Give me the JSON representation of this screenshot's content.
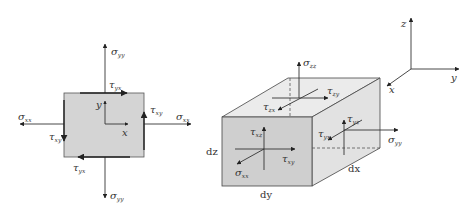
{
  "colors": {
    "background": "#ffffff",
    "line": "#333333",
    "square_fill": "#d4d4d4",
    "front_face": "#cfcfcf",
    "top_face": "#ebebeb",
    "side_face": "#e2e2e2"
  },
  "plane_element": {
    "labels": {
      "sigma_yy_top": {
        "sym": "σ",
        "sub": "yy"
      },
      "sigma_yy_bottom": {
        "sym": "σ",
        "sub": "yy"
      },
      "sigma_xx_left": {
        "sym": "σ",
        "sub": "xx"
      },
      "sigma_xx_right": {
        "sym": "σ",
        "sub": "xx"
      },
      "tau_yx_top": {
        "sym": "τ",
        "sub": "yx"
      },
      "tau_yx_bottom": {
        "sym": "τ",
        "sub": "yx"
      },
      "tau_xy_left": {
        "sym": "τ",
        "sub": "xy"
      },
      "tau_xy_right": {
        "sym": "τ",
        "sub": "xy"
      },
      "axis_x": "x",
      "axis_y": "y"
    }
  },
  "cube_element": {
    "labels": {
      "sigma_zz": {
        "sym": "σ",
        "sub": "zz"
      },
      "tau_zx": {
        "sym": "τ",
        "sub": "zx"
      },
      "tau_zy": {
        "sym": "τ",
        "sub": "zy"
      },
      "tau_xz": {
        "sym": "τ",
        "sub": "xz"
      },
      "tau_xy": {
        "sym": "τ",
        "sub": "xy"
      },
      "sigma_xx": {
        "sym": "σ",
        "sub": "xx"
      },
      "tau_yz": {
        "sym": "τ",
        "sub": "yz"
      },
      "tau_yx": {
        "sym": "τ",
        "sub": "yx"
      },
      "sigma_yy": {
        "sym": "σ",
        "sub": "yy"
      },
      "dz": "dz",
      "dy": "dy",
      "dx": "dx"
    }
  },
  "coordinate_axes": {
    "z": "z",
    "y": "y",
    "x": "x"
  }
}
